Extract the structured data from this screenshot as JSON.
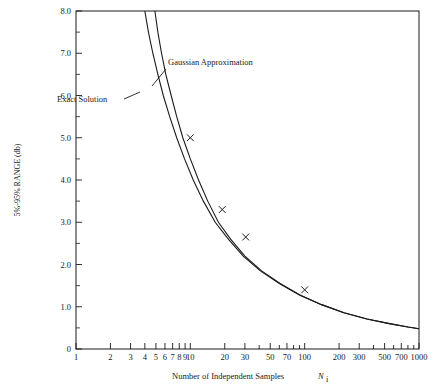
{
  "chart_data": {
    "type": "line",
    "title": "",
    "xlabel": "Number of Independent Samples",
    "xlabel_symbol": "N",
    "xlabel_symbol_sub": "i",
    "ylabel": "5%-95%  RANGE (db)",
    "xscale": "log",
    "xlim": [
      1,
      1000
    ],
    "ylim": [
      0,
      8
    ],
    "grid": false,
    "legend": "none",
    "xticks": [
      "1",
      "2",
      "3",
      "4",
      "5",
      "6",
      "7",
      "8",
      "9",
      "10",
      "20",
      "30",
      "40",
      "50",
      "60",
      "70",
      "80",
      "90",
      "100",
      "200",
      "300",
      "400",
      "500",
      "600",
      "700",
      "800",
      "900",
      "1000"
    ],
    "xtick_labeled": [
      "1",
      "2",
      "3",
      "4",
      "5",
      "6",
      "7",
      "8",
      "9",
      "10",
      "20",
      "30",
      "50",
      "70",
      "100",
      "200",
      "300",
      "500",
      "700",
      "1000"
    ],
    "yticks": [
      "0",
      "1.0",
      "2.0",
      "3.0",
      "4.0",
      "5.0",
      "6.0",
      "7.0",
      "8.0"
    ],
    "annotations": [
      {
        "text": "Gaussian Approximation",
        "x": 168,
        "y": 62
      },
      {
        "text": "Exact Solution",
        "x": 57,
        "y": 99
      }
    ],
    "series": [
      {
        "name": "Exact Solution",
        "style": "solid",
        "points": [
          {
            "x": 4.0,
            "y": 8.0
          },
          {
            "x": 4.3,
            "y": 7.5
          },
          {
            "x": 4.7,
            "y": 7.0
          },
          {
            "x": 5.2,
            "y": 6.5
          },
          {
            "x": 5.8,
            "y": 6.0
          },
          {
            "x": 6.6,
            "y": 5.5
          },
          {
            "x": 7.6,
            "y": 5.0
          },
          {
            "x": 8.9,
            "y": 4.5
          },
          {
            "x": 10.6,
            "y": 4.0
          },
          {
            "x": 13.0,
            "y": 3.5
          },
          {
            "x": 16.5,
            "y": 3.0
          },
          {
            "x": 21.5,
            "y": 2.6
          },
          {
            "x": 29.0,
            "y": 2.2
          },
          {
            "x": 41.0,
            "y": 1.85
          },
          {
            "x": 60.0,
            "y": 1.55
          },
          {
            "x": 90.0,
            "y": 1.28
          },
          {
            "x": 140.0,
            "y": 1.05
          },
          {
            "x": 220.0,
            "y": 0.86
          },
          {
            "x": 350.0,
            "y": 0.71
          },
          {
            "x": 550.0,
            "y": 0.6
          },
          {
            "x": 800.0,
            "y": 0.52
          },
          {
            "x": 1000.0,
            "y": 0.48
          }
        ]
      },
      {
        "name": "Gaussian Approximation",
        "style": "solid",
        "points": [
          {
            "x": 4.9,
            "y": 8.0
          },
          {
            "x": 5.2,
            "y": 7.5
          },
          {
            "x": 5.6,
            "y": 7.0
          },
          {
            "x": 6.1,
            "y": 6.5
          },
          {
            "x": 6.8,
            "y": 6.0
          },
          {
            "x": 7.6,
            "y": 5.5
          },
          {
            "x": 8.6,
            "y": 5.0
          },
          {
            "x": 10.0,
            "y": 4.5
          },
          {
            "x": 11.8,
            "y": 4.0
          },
          {
            "x": 14.2,
            "y": 3.5
          },
          {
            "x": 17.6,
            "y": 3.0
          },
          {
            "x": 22.5,
            "y": 2.6
          },
          {
            "x": 30.0,
            "y": 2.2
          },
          {
            "x": 42.0,
            "y": 1.85
          },
          {
            "x": 61.0,
            "y": 1.55
          },
          {
            "x": 91.0,
            "y": 1.28
          },
          {
            "x": 141.0,
            "y": 1.05
          },
          {
            "x": 221.0,
            "y": 0.86
          },
          {
            "x": 351.0,
            "y": 0.71
          },
          {
            "x": 551.0,
            "y": 0.6
          },
          {
            "x": 801.0,
            "y": 0.52
          },
          {
            "x": 1000.0,
            "y": 0.48
          }
        ]
      }
    ],
    "markers": [
      {
        "x": 10.0,
        "y": 5.0,
        "symbol": "x"
      },
      {
        "x": 19.0,
        "y": 3.3,
        "symbol": "x"
      },
      {
        "x": 30.5,
        "y": 2.65,
        "symbol": "x"
      },
      {
        "x": 100.0,
        "y": 1.4,
        "symbol": "x"
      }
    ]
  }
}
